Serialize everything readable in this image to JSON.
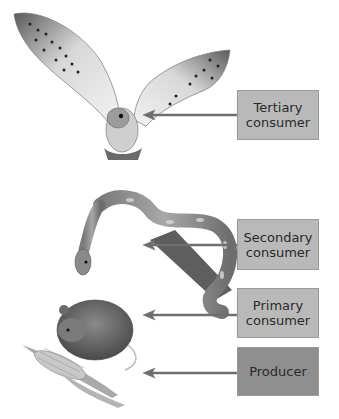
{
  "diagram": {
    "title": "",
    "levels": [
      {
        "id": "tertiary",
        "line1": "Tertiary",
        "line2": "consumer",
        "organism": "owl",
        "box_color": "#b9b9b9"
      },
      {
        "id": "secondary",
        "line1": "Secondary",
        "line2": "consumer",
        "organism": "snake",
        "box_color": "#b9b9b9"
      },
      {
        "id": "primary",
        "line1": "Primary",
        "line2": "consumer",
        "organism": "mouse",
        "box_color": "#b9b9b9"
      },
      {
        "id": "producer",
        "line1": "Producer",
        "line2": "",
        "organism": "corn",
        "box_color": "#8f8f8f"
      }
    ]
  }
}
